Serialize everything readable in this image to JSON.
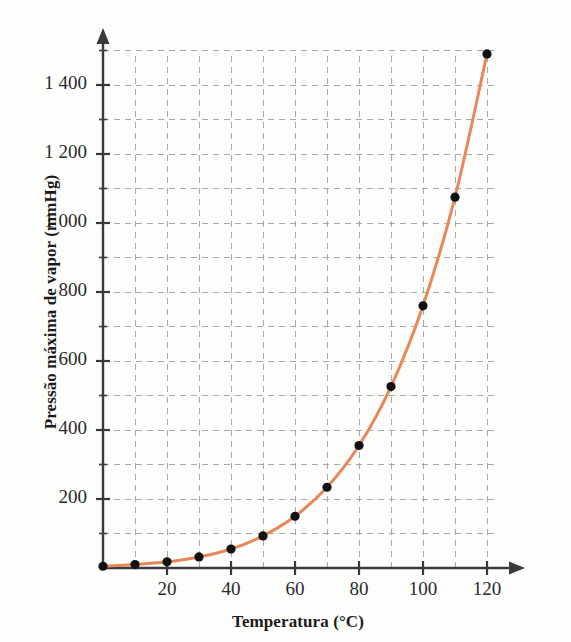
{
  "figure": {
    "credit": "ERICSON GUILHERME LUCIANO",
    "curve_color": "#E8875A",
    "point_color": "#111111",
    "axis_color": "#3a3a3a",
    "grid_color": "#9a9a9a"
  },
  "chart_data": {
    "type": "line",
    "title": "",
    "xlabel": "Temperatura (°C)",
    "ylabel": "Pressão máxima de vapor (mmHg)",
    "xlim": [
      0,
      125
    ],
    "ylim": [
      0,
      1560
    ],
    "grid": true,
    "grid_x_step": 10,
    "grid_y_step": 100,
    "legend": "none",
    "x_ticks": [
      0,
      20,
      40,
      60,
      80,
      100,
      120
    ],
    "x_tick_labels": [
      "",
      "20",
      "40",
      "60",
      "80",
      "100",
      "120"
    ],
    "x_minor_ticks": [
      10,
      30,
      50,
      70,
      90,
      110
    ],
    "y_ticks": [
      200,
      400,
      600,
      800,
      1000,
      1200,
      1400
    ],
    "y_tick_labels": [
      "200",
      "400",
      "600",
      "800",
      "1 000",
      "1 200",
      "1 400"
    ],
    "series": [
      {
        "name": "Pressão máxima de vapor da água",
        "x": [
          0,
          10,
          20,
          30,
          40,
          50,
          60,
          70,
          80,
          90,
          100,
          110,
          120
        ],
        "values": [
          5,
          10,
          18,
          32,
          55,
          93,
          150,
          234,
          355,
          526,
          760,
          1075,
          1490
        ],
        "marker": "circle",
        "line_style": "solid"
      }
    ]
  }
}
